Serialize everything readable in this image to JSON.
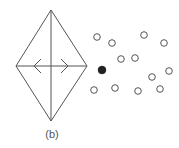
{
  "figure": {
    "label": "(b)",
    "stroke_color": "#555555",
    "diamond": {
      "top": [
        51,
        10
      ],
      "left": [
        16,
        66
      ],
      "right": [
        87,
        66
      ],
      "bottom": [
        51,
        121
      ]
    },
    "arrows": [
      {
        "direction": "left",
        "tip": [
          34,
          66
        ]
      },
      {
        "direction": "right",
        "tip": [
          68,
          66
        ]
      }
    ],
    "points": [
      {
        "x": 97,
        "y": 37,
        "filled": false
      },
      {
        "x": 112,
        "y": 43,
        "filled": false
      },
      {
        "x": 144,
        "y": 35,
        "filled": false
      },
      {
        "x": 164,
        "y": 43,
        "filled": false
      },
      {
        "x": 121,
        "y": 59,
        "filled": false
      },
      {
        "x": 135,
        "y": 58,
        "filled": false
      },
      {
        "x": 102,
        "y": 70,
        "filled": true
      },
      {
        "x": 169,
        "y": 71,
        "filled": false
      },
      {
        "x": 152,
        "y": 77,
        "filled": false
      },
      {
        "x": 94,
        "y": 90,
        "filled": false
      },
      {
        "x": 115,
        "y": 88,
        "filled": false
      },
      {
        "x": 138,
        "y": 91,
        "filled": false
      },
      {
        "x": 160,
        "y": 89,
        "filled": false
      }
    ]
  }
}
